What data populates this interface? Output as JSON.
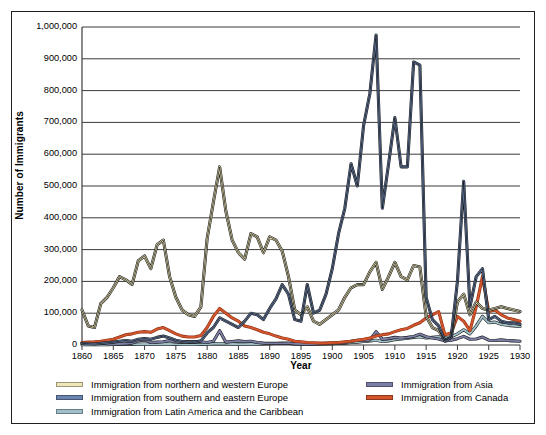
{
  "chart_data": {
    "type": "line",
    "title": "",
    "xlabel": "Year",
    "ylabel": "Number of Immigrants",
    "xlim": [
      1860,
      1930
    ],
    "ylim": [
      0,
      1000000
    ],
    "grid": true,
    "legend_position": "bottom",
    "x_ticks": [
      "1860",
      "1865",
      "1870",
      "1875",
      "1880",
      "1885",
      "1890",
      "1895",
      "1900",
      "1905",
      "1910",
      "1915",
      "1920",
      "1925",
      "1930"
    ],
    "y_ticks": [
      "0",
      "100,000",
      "200,000",
      "300,000",
      "400,000",
      "500,000",
      "600,000",
      "700,000",
      "800,000",
      "900,000",
      "1,000,000"
    ],
    "x": [
      1860,
      1861,
      1862,
      1863,
      1864,
      1865,
      1866,
      1867,
      1868,
      1869,
      1870,
      1871,
      1872,
      1873,
      1874,
      1875,
      1876,
      1877,
      1878,
      1879,
      1880,
      1881,
      1882,
      1883,
      1884,
      1885,
      1886,
      1887,
      1888,
      1889,
      1890,
      1891,
      1892,
      1893,
      1894,
      1895,
      1896,
      1897,
      1898,
      1899,
      1900,
      1901,
      1902,
      1903,
      1904,
      1905,
      1906,
      1907,
      1908,
      1909,
      1910,
      1911,
      1912,
      1913,
      1914,
      1915,
      1916,
      1917,
      1918,
      1919,
      1920,
      1921,
      1922,
      1923,
      1924,
      1925,
      1926,
      1927,
      1928,
      1929,
      1930
    ],
    "series": [
      {
        "name": "Immigration from northern and western Europe",
        "color": "#EFE7B8",
        "outline": "#1a1a1a",
        "values": [
          110000,
          60000,
          55000,
          130000,
          150000,
          180000,
          215000,
          205000,
          190000,
          265000,
          280000,
          240000,
          315000,
          330000,
          215000,
          150000,
          110000,
          95000,
          90000,
          120000,
          335000,
          450000,
          560000,
          420000,
          330000,
          290000,
          270000,
          350000,
          340000,
          290000,
          340000,
          330000,
          295000,
          215000,
          110000,
          95000,
          120000,
          75000,
          65000,
          80000,
          95000,
          110000,
          150000,
          180000,
          190000,
          190000,
          230000,
          260000,
          175000,
          215000,
          260000,
          215000,
          205000,
          250000,
          245000,
          90000,
          55000,
          45000,
          15000,
          25000,
          135000,
          160000,
          95000,
          135000,
          115000,
          110000,
          115000,
          120000,
          115000,
          110000,
          105000
        ]
      },
      {
        "name": "Immigration from southern and eastern Europe",
        "color": "#6C85B0",
        "outline": "#1a1a1a",
        "values": [
          5000,
          4000,
          3000,
          5000,
          7000,
          9000,
          12000,
          14000,
          12000,
          18000,
          20000,
          18000,
          24000,
          28000,
          22000,
          15000,
          11000,
          9000,
          9000,
          13000,
          38000,
          55000,
          85000,
          75000,
          65000,
          55000,
          75000,
          100000,
          95000,
          80000,
          115000,
          145000,
          190000,
          160000,
          80000,
          75000,
          190000,
          100000,
          110000,
          160000,
          240000,
          350000,
          430000,
          570000,
          500000,
          690000,
          790000,
          975000,
          430000,
          570000,
          715000,
          560000,
          560000,
          890000,
          880000,
          150000,
          80000,
          60000,
          12000,
          25000,
          200000,
          515000,
          120000,
          215000,
          240000,
          80000,
          90000,
          75000,
          70000,
          70000,
          65000
        ]
      },
      {
        "name": "Immigration from Latin America and the Caribbean",
        "color": "#9FC0C8",
        "outline": "#1a1a1a",
        "values": [
          1000,
          1000,
          1000,
          1000,
          1000,
          1500,
          2000,
          2000,
          2000,
          2500,
          3000,
          2500,
          3000,
          3500,
          3000,
          2000,
          1500,
          1500,
          1500,
          2000,
          3000,
          3500,
          4000,
          3500,
          3000,
          2500,
          2500,
          3000,
          3000,
          3000,
          4000,
          4500,
          5000,
          4500,
          3000,
          3000,
          3500,
          2500,
          2500,
          3000,
          4000,
          5000,
          6000,
          8000,
          9000,
          11000,
          13000,
          15000,
          11000,
          13000,
          17000,
          19000,
          21000,
          24000,
          26000,
          22000,
          24000,
          26000,
          23000,
          26000,
          35000,
          48000,
          35000,
          60000,
          90000,
          70000,
          72000,
          65000,
          62000,
          60000,
          58000
        ]
      },
      {
        "name": "Immigration from Asia",
        "color": "#7C7FA5",
        "outline": "#1a1a1a",
        "values": [
          6000,
          7000,
          5000,
          7000,
          4000,
          3000,
          3000,
          4000,
          6000,
          13000,
          16000,
          8000,
          9000,
          10000,
          14000,
          10000,
          9000,
          11000,
          10000,
          10000,
          8000,
          12000,
          45000,
          9000,
          11000,
          13000,
          11000,
          12000,
          8000,
          6000,
          5000,
          5000,
          5000,
          6000,
          4000,
          3000,
          3000,
          3000,
          4000,
          5000,
          6000,
          7000,
          8000,
          12000,
          15000,
          14000,
          16000,
          42000,
          18000,
          20000,
          24000,
          22000,
          24000,
          27000,
          34000,
          26000,
          22000,
          19000,
          13000,
          15000,
          20000,
          27000,
          18000,
          19000,
          25000,
          15000,
          14000,
          16000,
          14000,
          13000,
          12000
        ]
      },
      {
        "name": "Immigration from Canada",
        "color": "#D4552C",
        "outline": "#8c3318",
        "values": [
          8000,
          9000,
          10000,
          12000,
          15000,
          18000,
          25000,
          32000,
          35000,
          40000,
          42000,
          40000,
          50000,
          55000,
          45000,
          35000,
          28000,
          25000,
          25000,
          30000,
          55000,
          90000,
          115000,
          100000,
          85000,
          75000,
          60000,
          55000,
          48000,
          40000,
          35000,
          28000,
          22000,
          18000,
          12000,
          10000,
          8000,
          7000,
          6000,
          6000,
          7000,
          8000,
          10000,
          12000,
          15000,
          18000,
          22000,
          28000,
          32000,
          35000,
          42000,
          48000,
          52000,
          62000,
          70000,
          85000,
          95000,
          105000,
          32000,
          38000,
          90000,
          75000,
          45000,
          120000,
          215000,
          105000,
          110000,
          95000,
          85000,
          80000,
          75000
        ]
      }
    ]
  },
  "legend": {
    "left_column": [
      {
        "label": "Immigration from northern and western Europe",
        "color": "#EFE7B8"
      },
      {
        "label": "Immigration from southern and eastern Europe",
        "color": "#6C85B0"
      },
      {
        "label": "Immigration from Latin America and the Caribbean",
        "color": "#9FC0C8"
      }
    ],
    "right_column": [
      {
        "label": "Immigration from Asia",
        "color": "#7C7FA5"
      },
      {
        "label": "Immigration from Canada",
        "color": "#D4552C"
      }
    ]
  }
}
